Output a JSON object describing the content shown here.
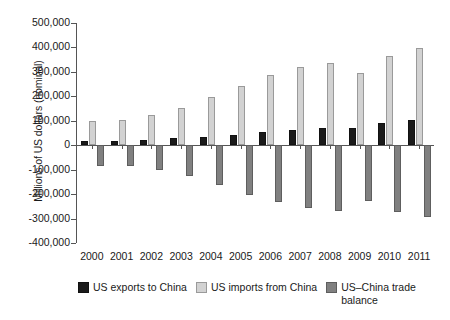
{
  "chart_data": {
    "type": "bar",
    "title": "",
    "xlabel": "",
    "ylabel": "Millions of US dollars (nominal)",
    "categories": [
      "2000",
      "2001",
      "2002",
      "2003",
      "2004",
      "2005",
      "2006",
      "2007",
      "2008",
      "2009",
      "2010",
      "2011"
    ],
    "ylim": [
      -400000,
      500000
    ],
    "ytick_values": [
      500000,
      400000,
      300000,
      200000,
      100000,
      0,
      -100000,
      -200000,
      -300000,
      -400000
    ],
    "ytick_labels": [
      "500,000",
      "400,000",
      "300,000",
      "200,000",
      "100,000",
      "0",
      "-100,000",
      "-200,000",
      "-300,000",
      "-400,000"
    ],
    "grid": false,
    "legend_position": "bottom",
    "series": [
      {
        "name": "US exports to China",
        "color": "#1a1a1a",
        "values": [
          16185,
          19182,
          22128,
          28368,
          34428,
          41192,
          53673,
          62937,
          69733,
          69497,
          91911,
          103940
        ]
      },
      {
        "name": "US imports from China",
        "color": "#d2d2d2",
        "values": [
          100018,
          102278,
          125193,
          152436,
          196682,
          243470,
          287774,
          321443,
          337773,
          296374,
          364953,
          399335
        ]
      },
      {
        "name": "US-China trade balance",
        "color": "#808080",
        "values": [
          -83833,
          -83096,
          -103065,
          -124068,
          -162254,
          -202278,
          -234101,
          -258506,
          -268040,
          -226877,
          -273042,
          -295395
        ]
      }
    ]
  },
  "legend": {
    "items": [
      {
        "label": "US exports to China",
        "swatch": "exports"
      },
      {
        "label": "US imports from China",
        "swatch": "imports"
      },
      {
        "label": "US–China trade balance",
        "swatch": "balance"
      }
    ]
  }
}
